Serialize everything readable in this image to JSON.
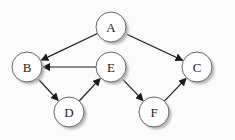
{
  "diagram": {
    "type": "directed-graph",
    "node_radius": 15,
    "nodes": [
      {
        "id": "A",
        "label": "A",
        "x": 111,
        "y": 27
      },
      {
        "id": "B",
        "label": "B",
        "x": 27,
        "y": 67
      },
      {
        "id": "C",
        "label": "C",
        "x": 197,
        "y": 67
      },
      {
        "id": "D",
        "label": "D",
        "x": 69,
        "y": 112
      },
      {
        "id": "E",
        "label": "E",
        "x": 111,
        "y": 67
      },
      {
        "id": "F",
        "label": "F",
        "x": 154,
        "y": 112
      }
    ],
    "edges": [
      {
        "from": "A",
        "to": "B"
      },
      {
        "from": "A",
        "to": "C"
      },
      {
        "from": "E",
        "to": "B"
      },
      {
        "from": "B",
        "to": "D"
      },
      {
        "from": "D",
        "to": "E"
      },
      {
        "from": "E",
        "to": "F"
      },
      {
        "from": "F",
        "to": "C"
      }
    ],
    "colors": {
      "background": "#fbfbfb",
      "node_fill": "#ffffff",
      "node_stroke": "#666666",
      "shadow": "#b8b8b8",
      "edge": "#1a1a1a",
      "text": "#222222"
    }
  }
}
